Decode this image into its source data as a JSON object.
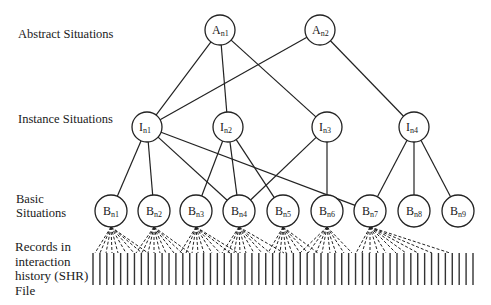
{
  "labels": {
    "abstract": "Abstract Situations",
    "instance": "Instance Situations",
    "basic_line1": "Basic",
    "basic_line2": "Situations",
    "records_line1": "Records in",
    "records_line2": "interaction",
    "records_line3": "history (SHR)",
    "records_line4": "File"
  },
  "nodes": {
    "abstract": [
      {
        "id": "An1",
        "letter": "A",
        "sub": "n1",
        "x": 220,
        "y": 30
      },
      {
        "id": "An2",
        "letter": "A",
        "sub": "n2",
        "x": 320,
        "y": 30
      }
    ],
    "instance": [
      {
        "id": "In1",
        "letter": "I",
        "sub": "n1",
        "x": 147,
        "y": 127
      },
      {
        "id": "In2",
        "letter": "I",
        "sub": "n2",
        "x": 228,
        "y": 127
      },
      {
        "id": "In3",
        "letter": "I",
        "sub": "n3",
        "x": 327,
        "y": 127
      },
      {
        "id": "In4",
        "letter": "I",
        "sub": "n4",
        "x": 414,
        "y": 127
      }
    ],
    "basic": [
      {
        "id": "Bn1",
        "letter": "B",
        "sub": "n1",
        "x": 111,
        "y": 211
      },
      {
        "id": "Bn2",
        "letter": "B",
        "sub": "n2",
        "x": 154,
        "y": 211
      },
      {
        "id": "Bn3",
        "letter": "B",
        "sub": "n3",
        "x": 196,
        "y": 211
      },
      {
        "id": "Bn4",
        "letter": "B",
        "sub": "n4",
        "x": 239,
        "y": 211
      },
      {
        "id": "Bn5",
        "letter": "B",
        "sub": "n5",
        "x": 283,
        "y": 211
      },
      {
        "id": "Bn6",
        "letter": "B",
        "sub": "n6",
        "x": 327,
        "y": 211
      },
      {
        "id": "Bn7",
        "letter": "B",
        "sub": "n7",
        "x": 370,
        "y": 211
      },
      {
        "id": "Bn8",
        "letter": "B",
        "sub": "n8",
        "x": 414,
        "y": 211
      },
      {
        "id": "Bn9",
        "letter": "B",
        "sub": "n9",
        "x": 458,
        "y": 211
      }
    ]
  },
  "edges": [
    [
      "An1",
      "In1"
    ],
    [
      "An1",
      "In2"
    ],
    [
      "An1",
      "In3"
    ],
    [
      "An2",
      "In1"
    ],
    [
      "An2",
      "In4"
    ],
    [
      "In1",
      "Bn1"
    ],
    [
      "In1",
      "Bn2"
    ],
    [
      "In1",
      "Bn4"
    ],
    [
      "In1",
      "Bn7"
    ],
    [
      "In2",
      "Bn3"
    ],
    [
      "In2",
      "Bn4"
    ],
    [
      "In2",
      "Bn5"
    ],
    [
      "In3",
      "Bn4"
    ],
    [
      "In3",
      "Bn6"
    ],
    [
      "In4",
      "Bn7"
    ],
    [
      "In4",
      "Bn8"
    ],
    [
      "In4",
      "Bn9"
    ]
  ],
  "record_links": {
    "Bn1": [
      95,
      100,
      106,
      112,
      118,
      126,
      134,
      142,
      148
    ],
    "Bn2": [
      136,
      142,
      148,
      154,
      160,
      166,
      174,
      182,
      190
    ],
    "Bn3": [
      180,
      186,
      192,
      198,
      204,
      212,
      220,
      230,
      238
    ],
    "Bn4": [
      222,
      228,
      234,
      240,
      246,
      254,
      262,
      270,
      284
    ],
    "Bn5": [
      268,
      274,
      280,
      286,
      292,
      300,
      308,
      318
    ],
    "Bn6": [
      300,
      308,
      316,
      322,
      330,
      336,
      344,
      352
    ],
    "Bn7": [
      356,
      362,
      370,
      378,
      386,
      396,
      406,
      418,
      432,
      450
    ]
  },
  "records": {
    "x_start": 93,
    "x_end": 473,
    "count": 56,
    "y_top": 253,
    "y_bottom": 285
  }
}
